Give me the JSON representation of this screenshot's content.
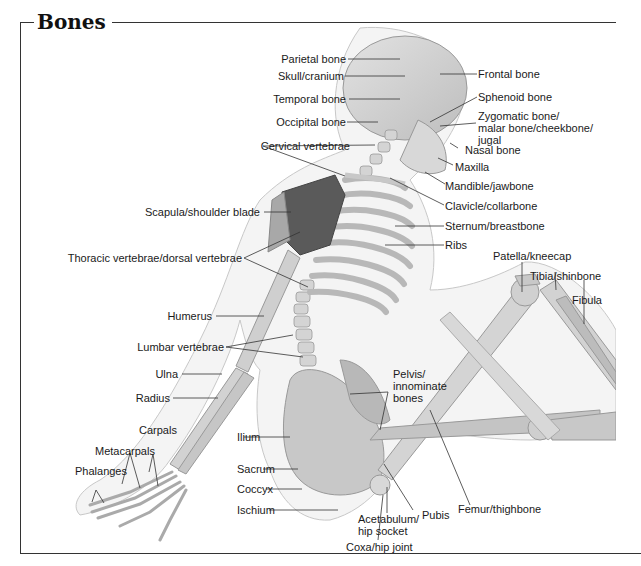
{
  "title": "Bones",
  "labels": {
    "parietal": "Parietal bone",
    "skull": "Skull/cranium",
    "temporal": "Temporal bone",
    "occipital": "Occipital bone",
    "cervical": "Cervical vertebrae",
    "frontal": "Frontal bone",
    "sphenoid": "Sphenoid bone",
    "zygomatic": "Zygomatic bone/\nmalar bone/cheekbone/\njugal",
    "nasal": "Nasal bone",
    "maxilla": "Maxilla",
    "mandible": "Mandible/jawbone",
    "clavicle": "Clavicle/collarbone",
    "sternum": "Sternum/breastbone",
    "ribs": "Ribs",
    "scapula": "Scapula/shoulder blade",
    "thoracic": "Thoracic vertebrae/dorsal vertebrae",
    "humerus": "Humerus",
    "lumbar": "Lumbar vertebrae",
    "ulna": "Ulna",
    "radius": "Radius",
    "carpals": "Carpals",
    "metacarpals": "Metacarpals",
    "phalanges": "Phalanges",
    "ilium": "Ilium",
    "sacrum": "Sacrum",
    "coccyx": "Coccyx",
    "ischium": "Ischium",
    "pelvis": "Pelvis/\ninnominate\nbones",
    "acetabulum": "Acetabulum/\nhip socket",
    "coxa": "Coxa/hip joint",
    "pubis": "Pubis",
    "femur": "Femur/thighbone",
    "patella": "Patella/kneecap",
    "tibia": "Tibia/shinbone",
    "fibula": "Fibula"
  }
}
